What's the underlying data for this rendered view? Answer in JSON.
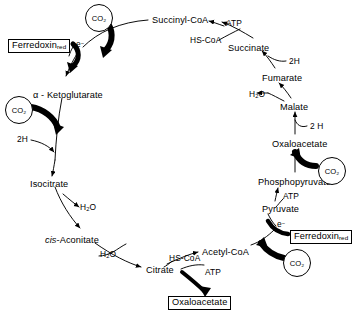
{
  "figure": {
    "type": "metabolic-pathway-diagram",
    "name": "Reductive (reverse) tricarboxylic acid cycle",
    "background_color": "#ffffff",
    "line_color": "#000000"
  },
  "metabolites": [
    {
      "id": "succinyl-coa",
      "label": "Succinyl-CoA",
      "x": 152,
      "y": 16
    },
    {
      "id": "succinate",
      "label": "Succinate",
      "x": 228,
      "y": 44
    },
    {
      "id": "fumarate",
      "label": "Fumarate",
      "x": 262,
      "y": 74
    },
    {
      "id": "malate",
      "label": "Malate",
      "x": 280,
      "y": 103
    },
    {
      "id": "oxaloacetate",
      "label": "Oxaloacetate",
      "x": 272,
      "y": 140
    },
    {
      "id": "phosphopyruvate",
      "label": "Phosphopyruvate",
      "x": 258,
      "y": 178
    },
    {
      "id": "pyruvate",
      "label": "Pyruvate",
      "x": 262,
      "y": 205
    },
    {
      "id": "acetyl-coa",
      "label": "Acetyl-CoA",
      "x": 202,
      "y": 248
    },
    {
      "id": "citrate",
      "label": "Citrate",
      "x": 146,
      "y": 266
    },
    {
      "id": "cis-aconitate",
      "label": "Aconitate",
      "prefix": "cis",
      "dash": "-",
      "x": 45,
      "y": 236
    },
    {
      "id": "isocitrate",
      "label": "Isocitrate",
      "x": 30,
      "y": 180
    },
    {
      "id": "alpha-ketoglutarate",
      "label": "α - Ketoglutarate",
      "x": 33,
      "y": 91
    }
  ],
  "cofactors": [
    {
      "id": "atp-succinyl",
      "label": "ATP",
      "x": 226,
      "y": 19
    },
    {
      "id": "hscoa-succinyl",
      "label": "HS-CoA",
      "x": 190,
      "y": 36
    },
    {
      "id": "2h-fumarate",
      "label": "2H",
      "x": 289,
      "y": 57
    },
    {
      "id": "h2o-malate",
      "label": "H₂O",
      "x": 249,
      "y": 90
    },
    {
      "id": "2h-malate",
      "label": "2 H",
      "x": 310,
      "y": 122
    },
    {
      "id": "atp-pep",
      "label": "ATP",
      "x": 283,
      "y": 192
    },
    {
      "id": "e-pyruvate",
      "label": "e⁻",
      "x": 277,
      "y": 222
    },
    {
      "id": "atp-citrate",
      "label": "ATP",
      "x": 205,
      "y": 268
    },
    {
      "id": "hscoa-citrate",
      "label": "HS-CoA",
      "x": 169,
      "y": 254
    },
    {
      "id": "h2o-aconitate",
      "label": "H₂O",
      "x": 100,
      "y": 250
    },
    {
      "id": "h2o-isocitrate",
      "label": "H₂O",
      "x": 80,
      "y": 205
    },
    {
      "id": "2h-isocitrate",
      "label": "2H",
      "x": 17,
      "y": 137
    },
    {
      "id": "e-ketoglutarate",
      "label": "e⁻",
      "x": 76,
      "y": 42
    }
  ],
  "boxed_labels": [
    {
      "id": "ferredoxin-red-left",
      "text": "Ferredoxin",
      "sub": "red",
      "x": 8,
      "y": 39
    },
    {
      "id": "ferredoxin-red-right",
      "text": "Ferredoxin",
      "sub": "red",
      "x": 290,
      "y": 230
    },
    {
      "id": "oxaloacetate-product",
      "text": "Oxaloacetate",
      "sub": "",
      "x": 168,
      "y": 296
    }
  ],
  "co2_nodes": [
    {
      "id": "co2-top",
      "label": "CO₂",
      "x": 85,
      "y": 4
    },
    {
      "id": "co2-left",
      "label": "CO₂",
      "x": 5,
      "y": 96
    },
    {
      "id": "co2-right",
      "label": "CO₂",
      "x": 318,
      "y": 157
    },
    {
      "id": "co2-bottom",
      "label": "CO₂",
      "x": 283,
      "y": 249
    }
  ],
  "reaction_arrows": [
    {
      "id": "alphakg-to-succinylcoa",
      "note": "carboxylation, ferredoxin-driven"
    },
    {
      "id": "succinylcoa-to-succinate",
      "note": "ATP + HS-CoA"
    },
    {
      "id": "succinate-to-fumarate",
      "note": "2H"
    },
    {
      "id": "fumarate-to-malate",
      "note": "H2O"
    },
    {
      "id": "malate-to-oxaloacetate",
      "note": "2 H"
    },
    {
      "id": "pep-to-oxaloacetate",
      "note": "CO2 fixation"
    },
    {
      "id": "pyruvate-to-pep",
      "note": "ATP"
    },
    {
      "id": "acetylcoa-to-pyruvate",
      "note": "CO2 + e-, ferredoxin"
    },
    {
      "id": "citrate-to-acetylcoa",
      "note": "ATP, HS-CoA"
    },
    {
      "id": "citrate-to-oxaloacetate-product",
      "note": "cleavage product"
    },
    {
      "id": "aconitate-to-citrate",
      "note": "H2O"
    },
    {
      "id": "isocitrate-to-aconitate",
      "note": "H2O"
    },
    {
      "id": "alphakg-to-isocitrate",
      "note": "2H"
    }
  ]
}
